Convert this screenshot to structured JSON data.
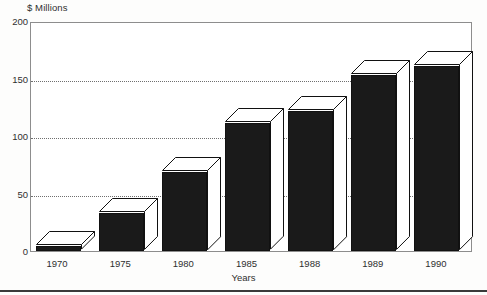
{
  "chart_data": {
    "type": "bar",
    "title": "",
    "subtitle": "",
    "ylabel": "$ Millions",
    "xlabel": "Years",
    "categories": [
      "1970",
      "1975",
      "1980",
      "1985",
      "1988",
      "1989",
      "1990"
    ],
    "values": [
      4,
      33,
      69,
      111,
      122,
      153,
      161
    ],
    "series": [
      {
        "name": "",
        "values": [
          4,
          33,
          69,
          111,
          122,
          153,
          161
        ]
      }
    ],
    "ylim": [
      0,
      200
    ],
    "y_ticks": [
      0,
      50,
      100,
      150,
      200
    ],
    "y_tick_labels": [
      "0",
      "50",
      "100",
      "150",
      "200"
    ],
    "grid": true,
    "grid_style": "dotted-horizontal",
    "legend": false,
    "legend_position": "none",
    "style": "3d-bars",
    "bar_face_color": "#1a1a1a",
    "bar_top_color": "#ffffff",
    "bar_outline_color": "#111111",
    "plot_border_color": "#8d8d8d",
    "gridline_color": "#6f6f6f",
    "background_color": "#ffffff",
    "text_color": "#2f2f2f"
  },
  "axes": {
    "y_unit_title": "$ Millions",
    "x_axis_title": "Years"
  }
}
